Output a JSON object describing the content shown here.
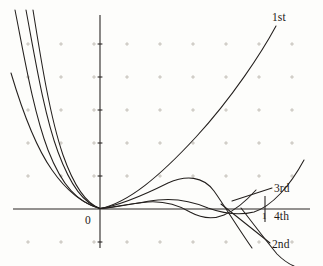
{
  "figure": {
    "title": "",
    "background_color": "#fdfdfb",
    "ink_color": "#231f1d",
    "grid_color": "#b9b4ac"
  },
  "axes": {
    "origin_label": "0",
    "x_tick_label": "1",
    "x_axis": {
      "x_start_px": 13,
      "x_end_px": 310,
      "y_px": 209
    },
    "y_axis": {
      "y_start_px": 15,
      "y_end_px": 248,
      "x_px": 100
    },
    "grid": {
      "enabled": true,
      "style": "plus-marks",
      "spacing_px": 33,
      "columns_px": [
        28,
        61,
        94,
        127,
        160,
        193,
        226,
        259,
        292
      ],
      "rows_px": [
        44,
        77,
        110,
        143,
        176,
        209,
        242
      ]
    },
    "y_ticks_px": [
      44,
      77,
      110,
      143,
      176,
      242
    ],
    "x_unit_tick": {
      "x_px": 265,
      "top_px": 196,
      "bottom_px": 222
    }
  },
  "labels": [
    {
      "id": "first",
      "text": "1st"
    },
    {
      "id": "second",
      "text": "2nd"
    },
    {
      "id": "third",
      "text": "3rd"
    },
    {
      "id": "fourth",
      "text": "4th"
    }
  ],
  "chart_data": {
    "type": "line",
    "title": "",
    "xlabel": "",
    "ylabel": "",
    "grid": true,
    "legend": "inline-leader-labels",
    "axis_origin_label": "0",
    "x_tick_labels": [
      "1"
    ],
    "series": [
      {
        "name": "1st",
        "label": "1st",
        "label_position": {
          "x_px": 272,
          "y_px": 12
        },
        "leader_line": null,
        "path_px": "M 15 10 C 24 55, 33 110, 48 150 C 62 186, 78 203, 100 208.5 C 128 203, 160 176, 196 137 C 232 98, 262 52, 276 26"
      },
      {
        "name": "2nd",
        "label": "2nd",
        "label_position": {
          "x_px": 272,
          "y_px": 239
        },
        "leader_line": {
          "x1_px": 221,
          "y1_px": 204,
          "x2_px": 270,
          "y2_px": 243
        },
        "path_px": "M 26 10 C 35 58, 44 114, 58 152 C 71 187, 84 203, 100 208.5 C 122 205, 146 194, 168 183 C 186 175, 203 176, 214 191 C 224 205, 238 228, 252 248"
      },
      {
        "name": "3rd",
        "label": "3rd",
        "label_position": {
          "x_px": 274,
          "y_px": 183
        },
        "leader_line": {
          "x1_px": 232,
          "y1_px": 201,
          "x2_px": 272,
          "y2_px": 188
        },
        "path_px": "M 11 73 C 22 110, 35 146, 52 170 C 68 193, 84 204, 100 208.5 C 120 207, 140 202, 158 200 C 176 198, 194 202, 208 208 C 222 213, 238 216, 254 212 C 272 206, 290 186, 304 160"
      },
      {
        "name": "4th",
        "label": "4th",
        "label_position": {
          "x_px": 274,
          "y_px": 211
        },
        "leader_line": null,
        "path_px": "M 33 10 C 41 60, 50 117, 63 155 C 75 189, 87 204, 100 208.5 C 116 207, 132 203, 148 202 C 164 201, 178 205, 190 212 C 201 218, 212 220, 224 215 C 236 210, 247 200, 256 190"
      },
      {
        "name": "4th-tail",
        "label": "",
        "label_position": null,
        "leader_line": null,
        "path_px": "M 241 208 C 252 222, 264 238, 277 254 C 283 260, 289 264, 294 266"
      }
    ]
  }
}
